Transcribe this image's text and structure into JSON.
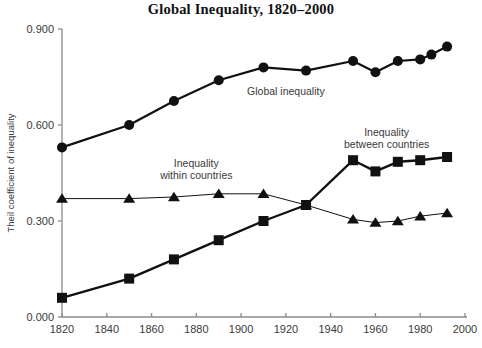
{
  "chart_data": {
    "type": "line",
    "title": "Global Inequality, 1820–2000",
    "xlabel": "",
    "ylabel": "Theil coefficient of inequality",
    "xlim": [
      1820,
      2000
    ],
    "ylim": [
      0.0,
      0.9
    ],
    "grid": false,
    "legend_position": "inline-annotations",
    "x_ticks": [
      1820,
      1840,
      1860,
      1880,
      1900,
      1920,
      1940,
      1960,
      1980,
      2000
    ],
    "x_tick_labels": [
      "1820",
      "1840",
      "1860",
      "1880",
      "1900",
      "1920",
      "1940",
      "1960",
      "1980",
      "2000"
    ],
    "y_ticks": [
      0.0,
      0.3,
      0.6,
      0.9
    ],
    "y_tick_labels": [
      "0.000",
      "0.300",
      "0.600",
      "0.900"
    ],
    "series": [
      {
        "name": "Global inequality",
        "marker": "circle",
        "x": [
          1820,
          1850,
          1870,
          1890,
          1910,
          1929,
          1950,
          1960,
          1970,
          1980,
          1985,
          1992
        ],
        "values": [
          0.53,
          0.6,
          0.675,
          0.74,
          0.78,
          0.77,
          0.8,
          0.765,
          0.8,
          0.805,
          0.82,
          0.845
        ]
      },
      {
        "name": "Inequality between countries",
        "marker": "square",
        "x": [
          1820,
          1850,
          1870,
          1890,
          1910,
          1929,
          1950,
          1960,
          1970,
          1980,
          1992
        ],
        "values": [
          0.06,
          0.12,
          0.18,
          0.24,
          0.3,
          0.35,
          0.49,
          0.455,
          0.485,
          0.49,
          0.5
        ]
      },
      {
        "name": "Inequality within countries",
        "marker": "triangle",
        "x": [
          1820,
          1850,
          1870,
          1890,
          1910,
          1929,
          1950,
          1960,
          1970,
          1980,
          1992
        ],
        "values": [
          0.37,
          0.37,
          0.375,
          0.385,
          0.385,
          0.35,
          0.305,
          0.295,
          0.3,
          0.315,
          0.325
        ]
      }
    ],
    "annotations": [
      {
        "text": "Global inequality",
        "x": 1920,
        "y": 0.695
      },
      {
        "text_line1": "Inequality",
        "text_line2": "within countries",
        "x": 1880,
        "y": 0.47
      },
      {
        "text_line1": "Inequality",
        "text_line2": "between countries",
        "x": 1965,
        "y": 0.565
      }
    ]
  }
}
